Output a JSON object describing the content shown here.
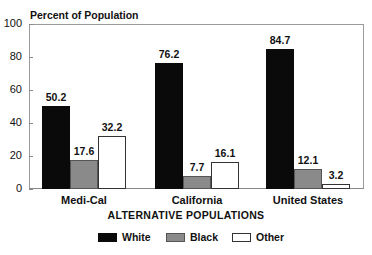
{
  "chart_data": {
    "type": "bar",
    "title": "Percent of Population",
    "xlabel": "ALTERNATIVE POPULATIONS",
    "ylabel": "Percent of Population",
    "ylim": [
      0,
      100
    ],
    "yticks": [
      "0",
      "20",
      "40",
      "60",
      "80",
      "100"
    ],
    "grid": false,
    "legend_position": "bottom",
    "categories": [
      "Medi-Cal",
      "California",
      "United States"
    ],
    "series": [
      {
        "name": "White",
        "values": [
          50.2,
          76.2,
          84.7
        ],
        "labels": [
          "50.2",
          "76.2",
          "84.7"
        ],
        "color": "#0a0a0a"
      },
      {
        "name": "Black",
        "values": [
          17.6,
          7.7,
          12.1
        ],
        "labels": [
          "17.6",
          "7.7",
          "12.1"
        ],
        "color": "#8a8a8a"
      },
      {
        "name": "Other",
        "values": [
          32.2,
          16.1,
          3.2
        ],
        "labels": [
          "32.2",
          "16.1",
          "3.2"
        ],
        "color": "#ffffff"
      }
    ]
  },
  "legend": [
    {
      "label": "White"
    },
    {
      "label": "Black"
    },
    {
      "label": "Other"
    }
  ]
}
